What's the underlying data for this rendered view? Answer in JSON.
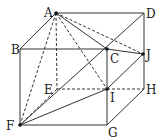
{
  "figure": {
    "type": "geometry-cube",
    "points": {
      "A": {
        "x": 56,
        "y": 13,
        "label": "A",
        "lx": 44,
        "ly": 17,
        "dot": true
      },
      "D": {
        "x": 144,
        "y": 13,
        "label": "D",
        "lx": 146,
        "ly": 18,
        "dot": false
      },
      "B": {
        "x": 20,
        "y": 49,
        "label": "B",
        "lx": 11,
        "ly": 54,
        "dot": false
      },
      "C": {
        "x": 107,
        "y": 49,
        "label": "C",
        "lx": 110,
        "ly": 63,
        "dot": true
      },
      "J": {
        "x": 143,
        "y": 54,
        "label": "J",
        "lx": 146,
        "ly": 59,
        "dot": true
      },
      "E": {
        "x": 57,
        "y": 89,
        "label": "E",
        "lx": 44,
        "ly": 94,
        "dot": false
      },
      "I": {
        "x": 107,
        "y": 89,
        "label": "I",
        "lx": 110,
        "ly": 102,
        "dot": true
      },
      "H": {
        "x": 144,
        "y": 89,
        "label": "H",
        "lx": 146,
        "ly": 94,
        "dot": false
      },
      "F": {
        "x": 20,
        "y": 125,
        "label": "F",
        "lx": 6,
        "ly": 130,
        "dot": true
      },
      "G": {
        "x": 107,
        "y": 125,
        "label": "G",
        "lx": 108,
        "ly": 137,
        "dot": false
      }
    },
    "solid_segments": [
      [
        "A",
        "D"
      ],
      [
        "D",
        "H"
      ],
      [
        "A",
        "B"
      ],
      [
        "B",
        "C"
      ],
      [
        "A",
        "C"
      ],
      [
        "C",
        "J"
      ],
      [
        "B",
        "F"
      ],
      [
        "F",
        "G"
      ],
      [
        "C",
        "G"
      ],
      [
        "G",
        "H"
      ],
      [
        "I",
        "J"
      ],
      [
        "F",
        "I"
      ],
      [
        "F",
        "D"
      ]
    ],
    "dashed_segments": [
      [
        "A",
        "F"
      ],
      [
        "A",
        "E"
      ],
      [
        "A",
        "I"
      ],
      [
        "A",
        "J"
      ],
      [
        "E",
        "H"
      ],
      [
        "E",
        "F"
      ]
    ],
    "colors": {
      "stroke": "#333333",
      "background": "#ffffff"
    }
  }
}
